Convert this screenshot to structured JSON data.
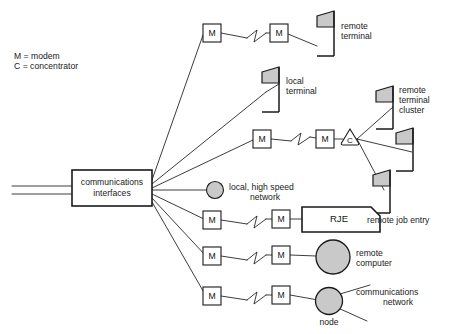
{
  "diagram": {
    "legend": {
      "line1": "M = modem",
      "line2": "C = concentrator"
    },
    "hub": {
      "label_line1": "communications",
      "label_line2": "interfaces"
    },
    "symbols": {
      "modem_letter": "M",
      "concentrator_letter": "C",
      "rje_label": "RJE"
    },
    "labels": [
      {
        "name": "remote-terminal",
        "line1": "remote",
        "line2": "terminal"
      },
      {
        "name": "local-terminal",
        "line1": "local",
        "line2": "terminal"
      },
      {
        "name": "remote-terminal-cluster",
        "line1": "remote",
        "line2": "terminal",
        "line3": "cluster"
      },
      {
        "name": "local-high-speed-network",
        "line1": "local, high speed",
        "line2": "network"
      },
      {
        "name": "remote-job-entry",
        "line1": "remote job entry"
      },
      {
        "name": "remote-computer",
        "line1": "remote",
        "line2": "computer"
      },
      {
        "name": "communications-network",
        "line1": "communications",
        "line2": "network"
      },
      {
        "name": "node",
        "line1": "node"
      }
    ],
    "colors": {
      "line": "#1a1a1a",
      "fill_gray": "#c9c9c9",
      "background": "#ffffff"
    },
    "counts": {
      "modems": 8,
      "terminals": 5,
      "concentrators": 1,
      "circles": 3
    }
  }
}
